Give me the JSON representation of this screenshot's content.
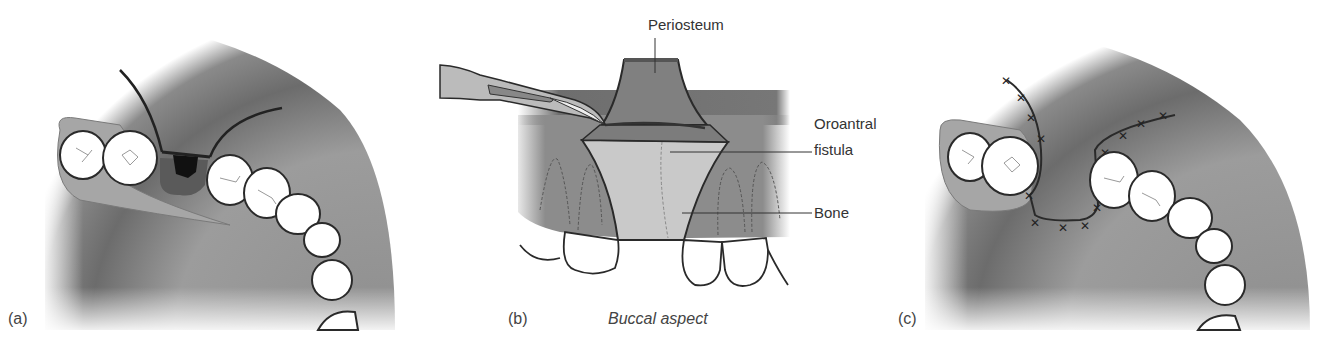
{
  "figure": {
    "panels": [
      {
        "id": "a",
        "label": "(a)",
        "description": "Occlusal view of maxillary arch with oroantral fistula at extraction site and incisions for buccal flap"
      },
      {
        "id": "b",
        "label": "(b)",
        "caption": "Buccal aspect",
        "description": "Scalpel incising periosteum of buccal flap",
        "annotations": [
          "Periosteum",
          "Oroantral fistula",
          "Bone"
        ]
      },
      {
        "id": "c",
        "label": "(c)",
        "description": "Flap advanced and sutured over fistula"
      }
    ],
    "labels": {
      "a": "(a)",
      "b": "(b)",
      "c": "(c)",
      "caption_b": "Buccal aspect",
      "periosteum": "Periosteum",
      "oroantral_line1": "Oroantral",
      "oroantral_line2": "fistula",
      "bone": "Bone"
    },
    "colors": {
      "palate_dark": "#6e6e6e",
      "palate_mid": "#9a9a9a",
      "gingiva": "#a8a8a8",
      "tooth": "#ffffff",
      "outline": "#2a2a2a",
      "fistula": "#111111",
      "socket": "#5a5a5a",
      "bone_light": "#c9c9c9"
    }
  }
}
